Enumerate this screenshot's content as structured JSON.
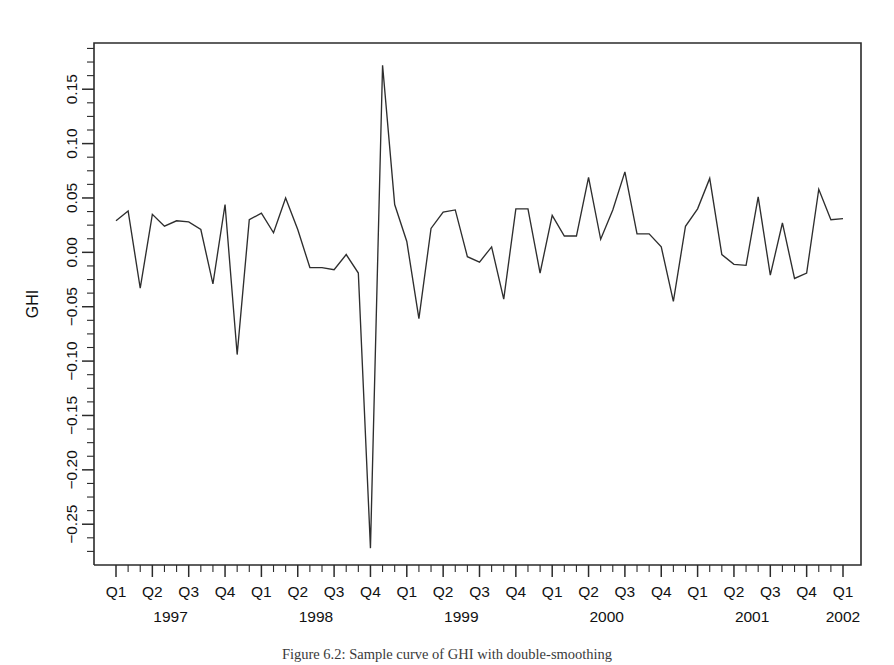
{
  "figure": {
    "caption": "Figure 6.2: Sample curve of GHI with double-smoothing",
    "background_color": "#ffffff",
    "line_color": "#2e2e2e",
    "axis_color": "#2b2b2b"
  },
  "chart_data": {
    "type": "line",
    "title": "",
    "subtitle": "",
    "xlabel": "",
    "ylabel": "GHI",
    "grid": false,
    "legend": null,
    "ylim": [
      -0.2875,
      0.1925
    ],
    "ytick_values": [
      0.15,
      0.1,
      0.05,
      0.0,
      -0.05,
      -0.1,
      -0.15,
      -0.2,
      -0.25
    ],
    "ytick_labels": [
      "0.15",
      "0.10",
      "0.05",
      "0.00",
      "−0.05",
      "−0.10",
      "−0.15",
      "−0.20",
      "−0.25"
    ],
    "y_minor_tick_step": 0.0125,
    "x_quarter_labels": [
      "Q1",
      "Q2",
      "Q3",
      "Q4",
      "Q1",
      "Q2",
      "Q3",
      "Q4",
      "Q1",
      "Q2",
      "Q3",
      "Q4",
      "Q1",
      "Q2",
      "Q3",
      "Q4",
      "Q1",
      "Q2",
      "Q3",
      "Q4",
      "Q1"
    ],
    "x_year_labels": [
      "1997",
      "1998",
      "1999",
      "2000",
      "2001",
      "2002"
    ],
    "x_year_quarter_index": [
      1.5,
      5.5,
      9.5,
      13.5,
      17.5,
      20.0
    ],
    "x_axis_unit": "month",
    "x_start_period": "1997-01",
    "x_n_points": 61,
    "series": [
      {
        "name": "GHI",
        "color": "#2e2e2e",
        "x": [
          "1997-01",
          "1997-02",
          "1997-03",
          "1997-04",
          "1997-05",
          "1997-06",
          "1997-07",
          "1997-08",
          "1997-09",
          "1997-10",
          "1997-11",
          "1997-12",
          "1998-01",
          "1998-02",
          "1998-03",
          "1998-04",
          "1998-05",
          "1998-06",
          "1998-07",
          "1998-08",
          "1998-09",
          "1998-10",
          "1998-11",
          "1998-12",
          "1999-01",
          "1999-02",
          "1999-03",
          "1999-04",
          "1999-05",
          "1999-06",
          "1999-07",
          "1999-08",
          "1999-09",
          "1999-10",
          "1999-11",
          "1999-12",
          "2000-01",
          "2000-02",
          "2000-03",
          "2000-04",
          "2000-05",
          "2000-06",
          "2000-07",
          "2000-08",
          "2000-09",
          "2000-10",
          "2000-11",
          "2000-12",
          "2001-01",
          "2001-02",
          "2001-03",
          "2001-04",
          "2001-05",
          "2001-06",
          "2001-07",
          "2001-08",
          "2001-09",
          "2001-10",
          "2001-11",
          "2001-12",
          "2002-01"
        ],
        "values": [
          0.029,
          0.038,
          -0.033,
          0.035,
          0.024,
          0.029,
          0.028,
          0.021,
          -0.029,
          0.044,
          -0.094,
          0.03,
          0.036,
          0.018,
          0.05,
          0.021,
          -0.014,
          -0.014,
          -0.016,
          -0.002,
          -0.019,
          -0.272,
          0.172,
          0.044,
          0.01,
          -0.061,
          0.022,
          0.037,
          0.039,
          -0.004,
          -0.009,
          0.005,
          -0.043,
          0.04,
          0.04,
          -0.019,
          0.034,
          0.015,
          0.015,
          0.069,
          0.012,
          0.039,
          0.074,
          0.017,
          0.017,
          0.005,
          -0.045,
          0.024,
          0.04,
          0.068,
          -0.002,
          -0.011,
          -0.012,
          0.051,
          -0.021,
          0.027,
          -0.024,
          -0.019,
          0.058,
          0.03,
          0.031
        ]
      }
    ],
    "annotations": [
      {
        "label": "crash trough",
        "x": "1998-10",
        "y": -0.272
      },
      {
        "label": "rebound peak",
        "x": "1998-11",
        "y": 0.172
      }
    ]
  }
}
